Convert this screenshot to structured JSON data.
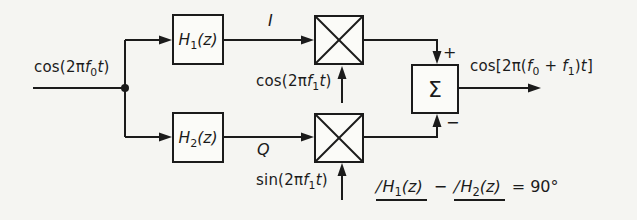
{
  "colors": {
    "ink": "#1b1b1b",
    "paper": "#f5f5f2",
    "box_fill": "#fbfbf8"
  },
  "diagram": {
    "input_signal": {
      "parts": [
        "cos(2π",
        "f",
        "0",
        "t",
        ")"
      ]
    },
    "branch_i": {
      "filter_label": {
        "parts": [
          "H",
          "1",
          "(z)"
        ]
      },
      "path_label": "I",
      "carrier_label": {
        "parts": [
          "cos(2π",
          "f",
          "1",
          "t",
          ")"
        ]
      }
    },
    "branch_q": {
      "filter_label": {
        "parts": [
          "H",
          "2",
          "(z)"
        ]
      },
      "path_label": "Q",
      "carrier_label": {
        "parts": [
          "sin(2π",
          "f",
          "1",
          "t",
          ")"
        ]
      }
    },
    "summer": {
      "symbol": "Σ",
      "plus_sign": "+",
      "minus_sign": "−"
    },
    "output_signal": {
      "parts": [
        "cos[2π(",
        "f",
        "0",
        " + ",
        "f",
        "1",
        ")",
        "t",
        "]"
      ]
    },
    "annotation": {
      "angle_glyph": "∕",
      "term1": {
        "parts": [
          "H",
          "1",
          "(z)"
        ]
      },
      "minus": "−",
      "term2": {
        "parts": [
          "H",
          "2",
          "(z)"
        ]
      },
      "result": "= 90°"
    }
  }
}
